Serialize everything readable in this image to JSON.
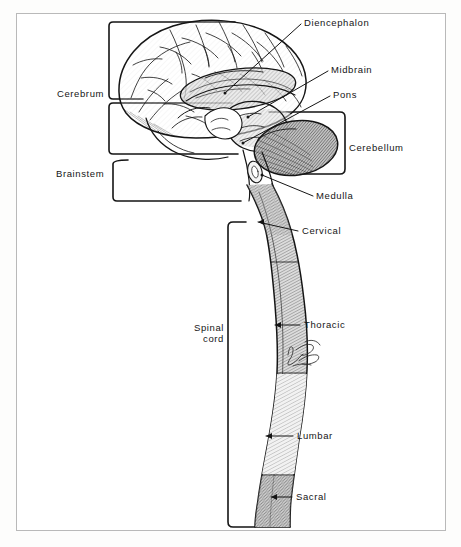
{
  "figure": {
    "style": "black-and-white line drawing with hatched shading",
    "signature": "illegible artist signature",
    "border_color": "#b9b9b9",
    "ink_color": "#151515",
    "paper_color": "#ffffff"
  },
  "labels": {
    "diencephalon": "Diencephalon",
    "midbrain": "Midbrain",
    "pons": "Pons",
    "cerebellum": "Cerebellum",
    "medulla": "Medulla",
    "cervical": "Cervical",
    "thoracic": "Thoracic",
    "lumbar": "Lumbar",
    "sacral": "Sacral",
    "cerebrum": "Cerebrum",
    "brainstem": "Brainstem",
    "spinal_cord_line1": "Spinal",
    "spinal_cord_line2": "cord"
  },
  "regions": [
    {
      "name": "Cerebrum",
      "group": "brain",
      "bracket": "left"
    },
    {
      "name": "Diencephalon",
      "group": "brain",
      "bracket": "none"
    },
    {
      "name": "Midbrain",
      "group": "brainstem",
      "bracket": "none"
    },
    {
      "name": "Pons",
      "group": "brainstem",
      "bracket": "none"
    },
    {
      "name": "Medulla",
      "group": "brainstem",
      "bracket": "none"
    },
    {
      "name": "Brainstem",
      "group": "brain",
      "bracket": "left"
    },
    {
      "name": "Cerebellum",
      "group": "brain",
      "bracket": "right"
    },
    {
      "name": "Cervical",
      "group": "spinal cord",
      "bracket": "none"
    },
    {
      "name": "Thoracic",
      "group": "spinal cord",
      "bracket": "none"
    },
    {
      "name": "Lumbar",
      "group": "spinal cord",
      "bracket": "none"
    },
    {
      "name": "Sacral",
      "group": "spinal cord",
      "bracket": "none"
    },
    {
      "name": "Spinal cord",
      "group": "cns",
      "bracket": "left"
    }
  ]
}
